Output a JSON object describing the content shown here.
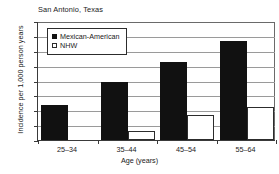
{
  "chart_data": {
    "type": "bar",
    "title": "San Antonio, Texas",
    "xlabel": "Age (years)",
    "ylabel": "Incidence per 1,000 person years",
    "categories": [
      "25–34",
      "35–44",
      "45–54",
      "55–64"
    ],
    "series": [
      {
        "name": "Mexican-American",
        "values": [
          4.7,
          7.8,
          10.5,
          13.3
        ],
        "color": "#111111",
        "swatch": "filled"
      },
      {
        "name": "NHW",
        "values": [
          0.0,
          1.2,
          3.3,
          4.4
        ],
        "color": "#ffffff",
        "swatch": "hollow"
      }
    ],
    "ylim": [
      0.0,
      16.0
    ],
    "ytick_values": [
      0.0,
      2.0,
      4.0,
      6.0,
      8.0,
      10.0,
      12.0,
      14.0,
      16.0
    ],
    "ytick_labels": [
      "0.0",
      "2.0",
      "4.0",
      "6.0",
      "8.0",
      "10.0",
      "12.0",
      "14.0",
      "16.0"
    ],
    "grid": true,
    "legend_position": "top-left-inside"
  },
  "legend": {
    "items": [
      {
        "label": "Mexican-American"
      },
      {
        "label": "NHW"
      }
    ]
  },
  "axes": {
    "title": "San Antonio, Texas",
    "x_axis_label": "Age (years)",
    "y_axis_label": "Incidence per 1,000 person years"
  }
}
